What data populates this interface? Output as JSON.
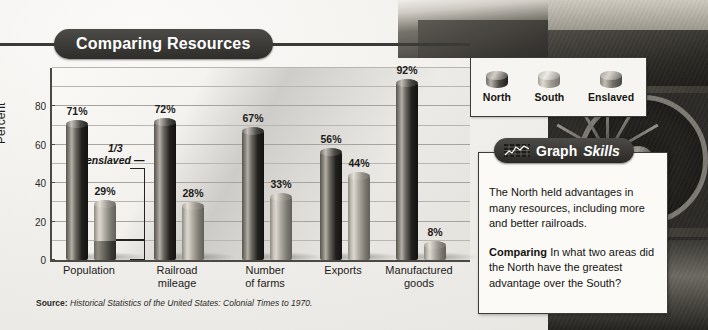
{
  "figure": {
    "title": "Comparing Resources",
    "source_prefix": "Source:",
    "source_text": "Historical Statistics of the United States: Colonial Times to 1970."
  },
  "chart_data": {
    "type": "bar",
    "title": "Comparing Resources",
    "xlabel": "",
    "ylabel": "Percent",
    "ylim": [
      0,
      100
    ],
    "yticks": [
      0,
      20,
      40,
      60,
      80
    ],
    "minor_gridline_step": 10,
    "grid": true,
    "legend_position": "top-right",
    "categories": [
      "Population",
      "Railroad mileage",
      "Number of farms",
      "Exports",
      "Manufactured goods"
    ],
    "series": [
      {
        "name": "North",
        "values": [
          71,
          72,
          67,
          56,
          92
        ],
        "color": "#201f1c"
      },
      {
        "name": "South",
        "values": [
          29,
          28,
          33,
          44,
          8
        ],
        "color": "#b0aca3"
      }
    ],
    "value_labels": {
      "North": [
        "71%",
        "72%",
        "67%",
        "56%",
        "92%"
      ],
      "South": [
        "29%",
        "28%",
        "33%",
        "44%",
        "8%"
      ]
    },
    "annotations": [
      {
        "text_line1": "1/3",
        "text_line2": "enslaved",
        "target_category": "Population",
        "target_series": "South",
        "meaning": "about one third of the South population bar was enslaved people",
        "segment_percent": 10
      }
    ],
    "source": "Source: Historical Statistics of the United States: Colonial Times to 1970."
  },
  "legend": {
    "items": [
      {
        "label": "North",
        "swatch": "cylinder-dark"
      },
      {
        "label": "South",
        "swatch": "cylinder-light"
      },
      {
        "label": "Enslaved",
        "swatch": "cylinder-medium"
      }
    ]
  },
  "skills_panel": {
    "badge_icon": "line-chart-icon",
    "badge_title": "Graph",
    "badge_subtitle": "Skills",
    "paragraph": "The North held advantages in many resources, including more and better railroads.",
    "question_label": "Comparing",
    "question_text": "In what two areas did the North have the greatest advantage over the South?"
  },
  "photo": {
    "description": "locomotive-photograph"
  }
}
